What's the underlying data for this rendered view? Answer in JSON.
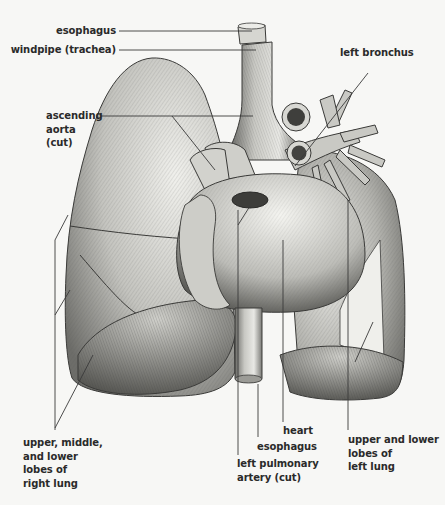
{
  "figure": {
    "colors": {
      "background": "#f7f7f5",
      "ink": "#2a2a2a",
      "lung_light": "#e4e4e0",
      "lung_mid": "#b9b9b4",
      "lung_dark": "#6e6e6a",
      "leader_line": "#3a3a3a"
    }
  },
  "labels": {
    "esophagus_top": "esophagus",
    "windpipe": "windpipe (trachea)",
    "left_bronchus": "left bronchus",
    "ascending_aorta": "ascending\naorta\n(cut)",
    "right_lung": "upper, middle,\nand lower\nlobes of\nright lung",
    "heart": "heart",
    "esophagus_bottom": "esophagus",
    "left_pulmonary_artery": "left pulmonary\nartery (cut)",
    "left_lung": "upper and lower\nlobes of\nleft lung"
  }
}
